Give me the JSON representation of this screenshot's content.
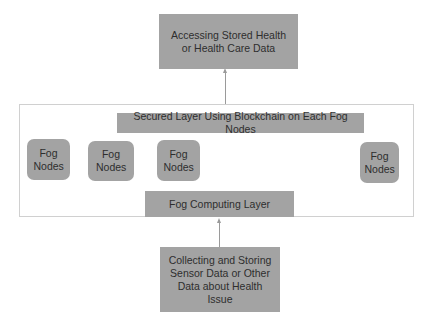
{
  "diagram": {
    "top_box": {
      "label": "Accessing Stored Health or Health Care Data"
    },
    "secured_layer": {
      "label": "Secured Layer Using Blockchain on Each Fog Nodes"
    },
    "fog_nodes": [
      {
        "label": "Fog Nodes"
      },
      {
        "label": "Fog Nodes"
      },
      {
        "label": "Fog Nodes"
      },
      {
        "label": "Fog Nodes"
      }
    ],
    "fog_computing_layer": {
      "label": "Fog Computing Layer"
    },
    "bottom_box": {
      "label": "Collecting and Storing Sensor Data or Other Data about Health Issue"
    },
    "edges": [
      {
        "from": "bottom_box",
        "to": "fog_computing_layer",
        "type": "arrow"
      },
      {
        "from": "container",
        "to": "top_box",
        "type": "arrow"
      }
    ],
    "colors": {
      "box_fill": "#a3a3a3",
      "border": "#d0d0d0",
      "line": "#9a9a9a"
    }
  }
}
